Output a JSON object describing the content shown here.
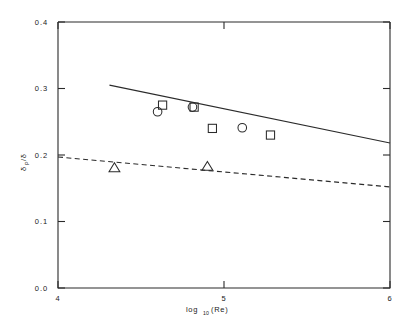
{
  "chart_data": {
    "type": "scatter",
    "title": "",
    "xlabel": "log10(Re)",
    "xlabel_base": "log",
    "xlabel_sub": "10",
    "xlabel_arg": "(Re)",
    "ylabel": "δP/δ",
    "ylabel_base": "δ",
    "ylabel_sub": "P",
    "ylabel_rest": "/δ",
    "xlim": [
      4,
      6
    ],
    "ylim": [
      0.0,
      0.4
    ],
    "xticks": [
      4,
      5,
      6
    ],
    "xtick_labels": [
      "4",
      "5",
      "6"
    ],
    "yticks": [
      0.0,
      0.1,
      0.2,
      0.3,
      0.4
    ],
    "ytick_labels": [
      "0.0",
      "0.1",
      "0.2",
      "0.3",
      "0.4"
    ],
    "grid": false,
    "legend": "none",
    "series": [
      {
        "name": "square-markers",
        "marker": "square",
        "points": [
          {
            "x": 4.63,
            "y": 0.275
          },
          {
            "x": 4.82,
            "y": 0.272
          },
          {
            "x": 4.93,
            "y": 0.24
          },
          {
            "x": 5.28,
            "y": 0.23
          }
        ]
      },
      {
        "name": "circle-markers",
        "marker": "circle",
        "points": [
          {
            "x": 4.6,
            "y": 0.265
          },
          {
            "x": 4.81,
            "y": 0.272
          },
          {
            "x": 5.11,
            "y": 0.241
          }
        ]
      },
      {
        "name": "triangle-markers",
        "marker": "triangle",
        "points": [
          {
            "x": 4.34,
            "y": 0.181
          },
          {
            "x": 4.9,
            "y": 0.183
          }
        ]
      }
    ],
    "lines": [
      {
        "name": "solid-trend-line",
        "style": "solid",
        "x": [
          4.31,
          6.0
        ],
        "y": [
          0.305,
          0.218
        ]
      },
      {
        "name": "dashed-trend-line",
        "style": "dashed",
        "x": [
          4.0,
          6.0
        ],
        "y": [
          0.197,
          0.152
        ]
      }
    ],
    "colors": {
      "axis": "#2b2b2b",
      "marker": "#2b2b2b",
      "line": "#2b2b2b",
      "background": "#ffffff"
    }
  }
}
